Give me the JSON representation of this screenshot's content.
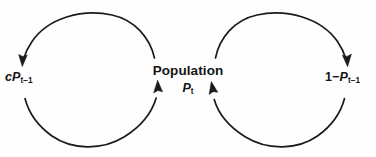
{
  "diagram": {
    "background_color": "#fefefe",
    "stroke_color": "#1a1a1a",
    "text_color": "#151515",
    "nodes": {
      "left": {
        "name": "left-term",
        "text": "cP t-1",
        "coefficient": "c",
        "variable": "P",
        "subscript": "t−1"
      },
      "center": {
        "name": "population-node",
        "line1": "Population",
        "variable": "P",
        "subscript": "t"
      },
      "right": {
        "name": "right-term",
        "prefix": "1",
        "operator": "−",
        "variable": "P",
        "subscript": "t−1"
      }
    },
    "loops": [
      {
        "name": "left-loop",
        "center_x": 90,
        "center_y": 80,
        "radius": 67,
        "direction": "clockwise",
        "arrowheads": 2
      },
      {
        "name": "right-loop",
        "center_x": 275,
        "center_y": 80,
        "radius": 67,
        "direction": "counter-clockwise",
        "arrowheads": 2
      }
    ]
  }
}
